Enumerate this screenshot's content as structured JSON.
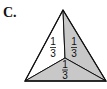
{
  "label": "C.",
  "diagram": {
    "shape": "triangle",
    "vertices": {
      "apex": [
        63,
        10
      ],
      "bottom_left": [
        25,
        81
      ],
      "bottom_right": [
        106,
        81
      ]
    },
    "interior_point": [
      65,
      58
    ],
    "regions": [
      {
        "name": "left",
        "fraction": {
          "numerator": "1",
          "denominator": "3"
        },
        "fill": "#ffffff"
      },
      {
        "name": "right",
        "fraction": {
          "numerator": "1",
          "denominator": "3"
        },
        "fill": "#c8c8c8"
      },
      {
        "name": "bottom",
        "fraction": {
          "numerator": "1",
          "denominator": "3"
        },
        "fill": "#c8c8c8"
      }
    ],
    "stroke": "#111111"
  }
}
